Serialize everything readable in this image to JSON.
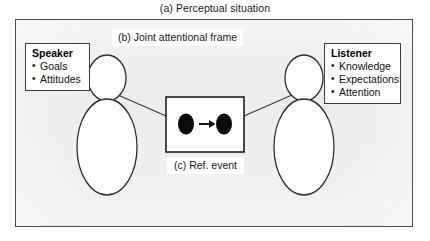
{
  "figure": {
    "caption_a": "(a) Perceptual situation",
    "caption_b": "(b) Joint attentional frame",
    "caption_c": "(c) Ref. event"
  },
  "speaker": {
    "title": "Speaker",
    "items": [
      {
        "label": "Goals"
      },
      {
        "label": "Attitudes"
      }
    ]
  },
  "listener": {
    "title": "Listener",
    "items": [
      {
        "label": "Knowledge"
      },
      {
        "label": "Expectations"
      },
      {
        "label": "Attention"
      }
    ]
  },
  "ref_event": {
    "left_entity": "filled-ellipse",
    "relation": "arrow-right",
    "right_entity": "filled-ellipse"
  },
  "colors": {
    "panel_background": "#eceded",
    "panel_border": "#4a4a4a",
    "box_background": "#ffffff",
    "box_border": "#3d3d3d",
    "ink": "#111111",
    "entity_fill": "#0a0a0a",
    "page_background": "#ffffff"
  }
}
